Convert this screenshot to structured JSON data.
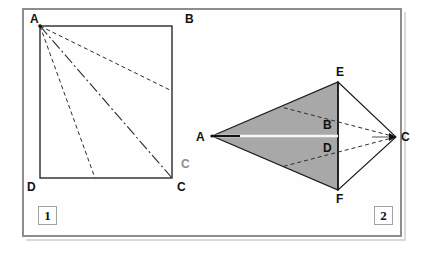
{
  "figure": {
    "background_color": "#ffffff",
    "panel_border_color": "#8d8d8d",
    "shaded_fill_color": "#a8a8a8",
    "stroke_color": "#1a1a1a"
  },
  "figure1": {
    "caption": "1",
    "shape": "square",
    "vertices": [
      {
        "name": "A",
        "label": "A",
        "x": 40,
        "y": 26,
        "label_x": 30,
        "label_y": 13
      },
      {
        "name": "B",
        "label": "B",
        "x": 172,
        "y": 26,
        "label_x": 185,
        "label_y": 13
      },
      {
        "name": "C",
        "label": "C",
        "x": 172,
        "y": 178,
        "label_x": 177,
        "label_y": 181
      },
      {
        "name": "D",
        "label": "D",
        "x": 40,
        "y": 178,
        "label_x": 27,
        "label_y": 181
      }
    ],
    "cevians": [
      {
        "name": "A-to-BC-point",
        "style": "dashed",
        "from": "A",
        "x1": 40,
        "y1": 26,
        "x2": 172,
        "y2": 91
      },
      {
        "name": "A-to-C-diagonal",
        "style": "dash-dot",
        "from": "A",
        "x1": 40,
        "y1": 26,
        "x2": 172,
        "y2": 178
      },
      {
        "name": "A-to-DC-point",
        "style": "dashed",
        "from": "A",
        "x1": 40,
        "y1": 26,
        "x2": 95,
        "y2": 178
      }
    ]
  },
  "figure2": {
    "caption": "2",
    "shape": "kite",
    "vertices": [
      {
        "name": "A",
        "label": "A",
        "x": 212,
        "y": 136,
        "label_x": 196,
        "label_y": 131
      },
      {
        "name": "E",
        "label": "E",
        "x": 338,
        "y": 82,
        "label_x": 336,
        "label_y": 66
      },
      {
        "name": "F",
        "label": "F",
        "x": 338,
        "y": 190,
        "label_x": 336,
        "label_y": 193
      },
      {
        "name": "C",
        "label": "C",
        "x": 396,
        "y": 137,
        "label_x": 401,
        "label_y": 131
      },
      {
        "name": "B",
        "label": "B",
        "x": 338,
        "y": 130,
        "label_x": 323,
        "label_y": 119
      },
      {
        "name": "D",
        "label": "D",
        "x": 338,
        "y": 143,
        "label_x": 323,
        "label_y": 142
      }
    ],
    "shaded_polygon": [
      {
        "x": 212,
        "y": 136
      },
      {
        "x": 338,
        "y": 82
      },
      {
        "x": 338,
        "y": 190
      }
    ],
    "outline_polygon": [
      {
        "x": 212,
        "y": 136
      },
      {
        "x": 338,
        "y": 82
      },
      {
        "x": 396,
        "y": 137
      },
      {
        "x": 338,
        "y": 190
      }
    ],
    "dashed_segments": [
      {
        "name": "C-to-upper-edge",
        "x1": 396,
        "y1": 137,
        "x2": 281,
        "y2": 107
      },
      {
        "name": "C-to-lower-edge",
        "x1": 396,
        "y1": 137,
        "x2": 281,
        "y2": 167
      }
    ],
    "axis_segment": {
      "name": "A-to-C-axis",
      "x1": 212,
      "y1": 136,
      "x2": 396,
      "y2": 137
    },
    "watermark": {
      "text": "C",
      "x": 181,
      "y": 158
    }
  }
}
